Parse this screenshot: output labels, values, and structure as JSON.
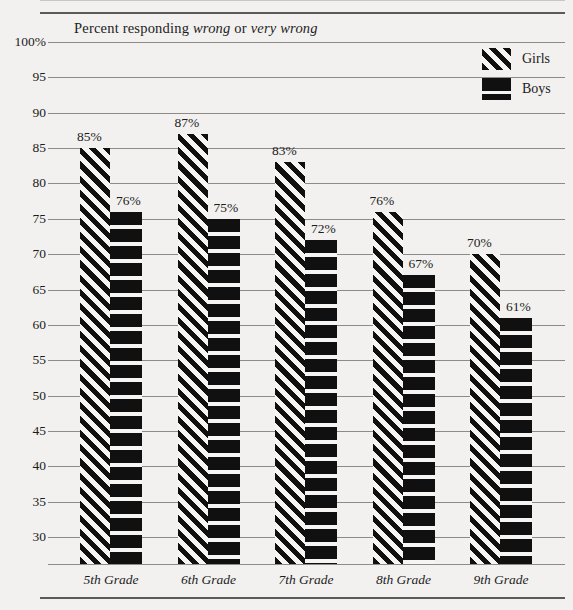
{
  "chart_data": {
    "type": "bar",
    "title": "Percent responding wrong or very wrong",
    "title_parts": [
      {
        "text": "Percent responding ",
        "italic": false
      },
      {
        "text": "wrong",
        "italic": true
      },
      {
        "text": " or ",
        "italic": false
      },
      {
        "text": "very wrong",
        "italic": true
      }
    ],
    "categories": [
      "5th Grade",
      "6th Grade",
      "7th Grade",
      "8th Grade",
      "9th Grade"
    ],
    "series": [
      {
        "name": "Girls",
        "values": [
          85,
          87,
          83,
          76,
          70
        ],
        "labels": [
          "85%",
          "87%",
          "83%",
          "76%",
          "70%"
        ],
        "pattern": "diagonal-stripes"
      },
      {
        "name": "Boys",
        "values": [
          76,
          75,
          72,
          67,
          61
        ],
        "labels": [
          "76%",
          "75%",
          "72%",
          "67%",
          "61%"
        ],
        "pattern": "solid-black-bands"
      }
    ],
    "xlabel": "",
    "ylabel": "",
    "ylim": [
      30,
      100
    ],
    "ytick_values": [
      100,
      95,
      90,
      85,
      80,
      75,
      70,
      65,
      60,
      55,
      50,
      45,
      40,
      35,
      30
    ],
    "ytick_labels": [
      "100%",
      "95",
      "90",
      "85",
      "80",
      "75",
      "70",
      "65",
      "60",
      "55",
      "50",
      "45",
      "40",
      "35",
      "30"
    ],
    "grid": true,
    "legend_position": "top-right",
    "bars_clipped_at_axis": true,
    "colors": {
      "ink": "#101010",
      "background": "#f2f1ef",
      "gridline": "#8d8b87",
      "rule": "#5a5a58"
    }
  },
  "legend": {
    "items": [
      {
        "label": "Girls",
        "swatch": "diagonal-stripe-swatch"
      },
      {
        "label": "Boys",
        "swatch": "solid-band-swatch"
      }
    ]
  }
}
